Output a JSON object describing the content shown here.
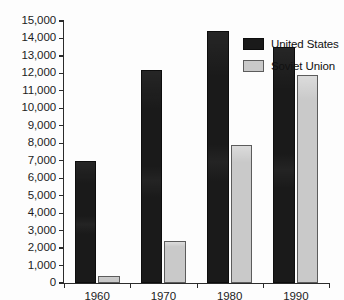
{
  "chart_data": {
    "type": "bar",
    "title": "",
    "xlabel": "",
    "ylabel": "",
    "categories": [
      "1960",
      "1970",
      "1980",
      "1990"
    ],
    "series": [
      {
        "name": "United States",
        "color": "#1a1a1a",
        "values": [
          7000,
          12200,
          14400,
          13500
        ]
      },
      {
        "name": "Soviet Union",
        "color": "#c9c9c9",
        "values": [
          400,
          2400,
          7900,
          11900
        ]
      }
    ],
    "ylim": [
      0,
      15000
    ],
    "ytick_values": [
      0,
      1000,
      2000,
      3000,
      4000,
      5000,
      6000,
      7000,
      8000,
      9000,
      10000,
      11000,
      12000,
      13000,
      14000,
      15000
    ],
    "ytick_labels": [
      "0",
      "1,000",
      "2,000",
      "3,000",
      "4,000",
      "5,000",
      "6,000",
      "7,000",
      "8,000",
      "9,000",
      "10,000",
      "11,000",
      "12,000",
      "13,000",
      "14,000",
      "15,000"
    ],
    "grid": false,
    "legend_position": "top-right"
  },
  "legend": {
    "entries": [
      {
        "label": "United States"
      },
      {
        "label": "Soviet Union"
      }
    ]
  },
  "footer": {
    "artifact_text": ""
  }
}
